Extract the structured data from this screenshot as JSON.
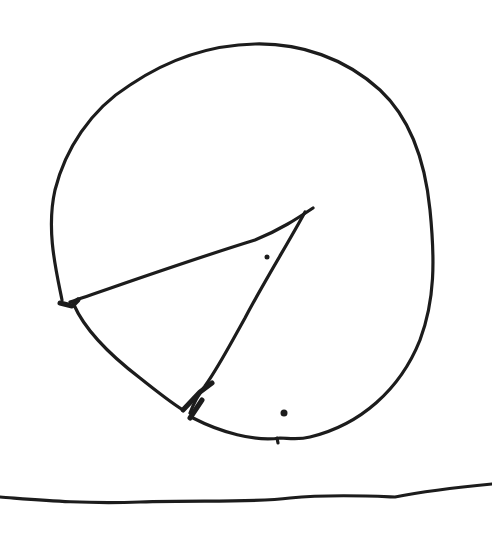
{
  "drawing": {
    "description": "Hand-drawn sketch of a circle divided into a wedge (pie shape) resting above a wavy horizontal ground line",
    "stroke_color": "#1c1c1c",
    "background_color": "#ffffff",
    "elements": [
      {
        "name": "outer-circle-shape",
        "type": "closed-curve"
      },
      {
        "name": "wedge-slice",
        "type": "triangle-like region",
        "vertex": [
          313,
          208
        ]
      },
      {
        "name": "dot-upper",
        "position": [
          267,
          257
        ]
      },
      {
        "name": "dot-lower",
        "position": [
          284,
          413
        ]
      },
      {
        "name": "ground-line",
        "type": "wavy line",
        "y_approx": 500
      }
    ]
  }
}
